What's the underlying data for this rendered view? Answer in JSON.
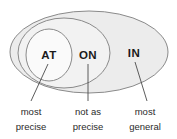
{
  "diagram": {
    "type": "nested-venn-ellipses",
    "colors": {
      "outer_fill": "#ececec",
      "middle_fill": "#f2f2f2",
      "inner_fill": "#fafafa",
      "stroke": "#8a8a8a",
      "text": "#1a1a1a",
      "caption_text": "#2b2b2b",
      "leader_line": "#4a4a4a",
      "background": "#ffffff"
    },
    "regions": [
      {
        "id": "at",
        "label": "AT",
        "caption_line1": "most",
        "caption_line2": "precise"
      },
      {
        "id": "on",
        "label": "ON",
        "caption_line1": "not as",
        "caption_line2": "precise"
      },
      {
        "id": "in",
        "label": "IN",
        "caption_line1": "most",
        "caption_line2": "general"
      }
    ]
  }
}
